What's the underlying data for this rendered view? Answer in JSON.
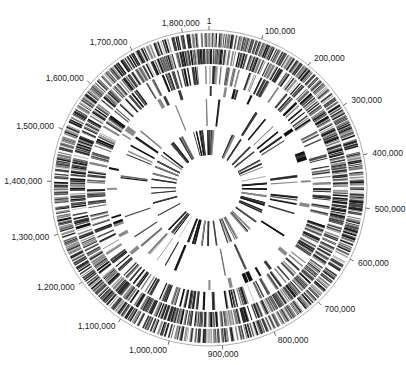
{
  "diagram": {
    "type": "circular-genome-map",
    "genome_length": 1850000,
    "center": [
      209,
      188
    ],
    "backbone_radius": 158,
    "backbone_color": "#9a9a9a",
    "feature_color": "#111111",
    "origin_label": "1",
    "ticks": [
      {
        "position": 1,
        "label": "1"
      },
      {
        "position": 100000,
        "label": "100,000"
      },
      {
        "position": 200000,
        "label": "200,000"
      },
      {
        "position": 300000,
        "label": "300,000"
      },
      {
        "position": 400000,
        "label": "400,000"
      },
      {
        "position": 500000,
        "label": "500,000"
      },
      {
        "position": 600000,
        "label": "600,000"
      },
      {
        "position": 700000,
        "label": "700,000"
      },
      {
        "position": 800000,
        "label": "800,000"
      },
      {
        "position": 900000,
        "label": "900,000"
      },
      {
        "position": 1000000,
        "label": "1,000,000"
      },
      {
        "position": 1100000,
        "label": "1,100,000"
      },
      {
        "position": 1200000,
        "label": "1,200,000"
      },
      {
        "position": 1300000,
        "label": "1,300,000"
      },
      {
        "position": 1400000,
        "label": "1,400,000"
      },
      {
        "position": 1500000,
        "label": "1,500,000"
      },
      {
        "position": 1600000,
        "label": "1,600,000"
      },
      {
        "position": 1700000,
        "label": "1,700,000"
      },
      {
        "position": 1800000,
        "label": "1,800,000"
      }
    ],
    "rings": [
      {
        "name": "genes-forward-strand",
        "r_outer": 155,
        "r_inner": 141,
        "density": 0.78,
        "seed": 11
      },
      {
        "name": "genes-reverse-strand",
        "r_outer": 139,
        "r_inner": 124,
        "density": 0.74,
        "seed": 23
      },
      {
        "name": "ring-3",
        "r_outer": 122,
        "r_inner": 104,
        "density": 0.22,
        "seed": 37
      },
      {
        "name": "ring-4",
        "r_outer": 102,
        "r_inner": 92,
        "density": 0.035,
        "seed": 41,
        "block": true
      },
      {
        "name": "ring-5",
        "r_outer": 89,
        "r_inner": 62,
        "density": 0.05,
        "seed": 53
      },
      {
        "name": "ring-6",
        "r_outer": 58,
        "r_inner": 33,
        "density": 0.06,
        "seed": 67
      }
    ]
  }
}
